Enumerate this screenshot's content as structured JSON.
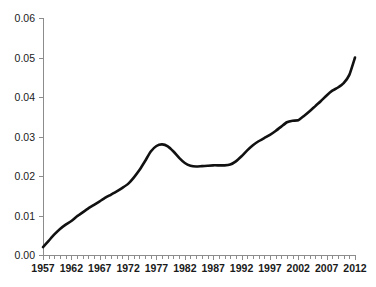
{
  "chart_data": {
    "type": "line",
    "title": "",
    "subtitle": "",
    "xlabel": "",
    "ylabel": "",
    "xlim": [
      1957,
      2012
    ],
    "ylim": [
      0.0,
      0.06
    ],
    "grid": false,
    "legend": null,
    "y_tick_labels": [
      "0.06",
      "0.05",
      "0.04",
      "0.03",
      "0.02",
      "0.01",
      "0.00"
    ],
    "y_tick_values": [
      0.06,
      0.05,
      0.04,
      0.03,
      0.02,
      0.01,
      0.0
    ],
    "x_tick_labels": [
      "1957",
      "1962",
      "1967",
      "1972",
      "1977",
      "1982",
      "1987",
      "1992",
      "1997",
      "2002",
      "2007",
      "2012"
    ],
    "x_tick_values": [
      1957,
      1962,
      1967,
      1972,
      1977,
      1982,
      1987,
      1992,
      1997,
      2002,
      2007,
      2012
    ],
    "x_minor_tick_interval": 1,
    "series": [
      {
        "name": "series-1",
        "color": "#111111",
        "x": [
          1957,
          1958,
          1959,
          1960,
          1961,
          1962,
          1963,
          1964,
          1965,
          1966,
          1967,
          1968,
          1969,
          1970,
          1971,
          1972,
          1973,
          1974,
          1975,
          1976,
          1977,
          1978,
          1979,
          1980,
          1981,
          1982,
          1983,
          1984,
          1985,
          1986,
          1987,
          1988,
          1989,
          1990,
          1991,
          1992,
          1993,
          1994,
          1995,
          1996,
          1997,
          1998,
          1999,
          2000,
          2001,
          2002,
          2003,
          2004,
          2005,
          2006,
          2007,
          2008,
          2009,
          2010,
          2011,
          2012
        ],
        "values": [
          0.002,
          0.0036,
          0.0052,
          0.0066,
          0.0077,
          0.0086,
          0.0098,
          0.0108,
          0.0118,
          0.0127,
          0.0136,
          0.0145,
          0.0153,
          0.0161,
          0.017,
          0.018,
          0.0196,
          0.0215,
          0.0238,
          0.0262,
          0.0276,
          0.028,
          0.0275,
          0.0262,
          0.0246,
          0.0233,
          0.0226,
          0.0224,
          0.0225,
          0.0226,
          0.0227,
          0.0227,
          0.0227,
          0.0229,
          0.0237,
          0.025,
          0.0265,
          0.0278,
          0.0288,
          0.0296,
          0.0304,
          0.0314,
          0.0325,
          0.0336,
          0.034,
          0.0341,
          0.0352,
          0.0364,
          0.0377,
          0.039,
          0.0404,
          0.0416,
          0.0424,
          0.0435,
          0.0456,
          0.05
        ]
      }
    ]
  },
  "plot_geometry": {
    "left": 43,
    "right": 355,
    "top": 18,
    "bottom": 255
  }
}
